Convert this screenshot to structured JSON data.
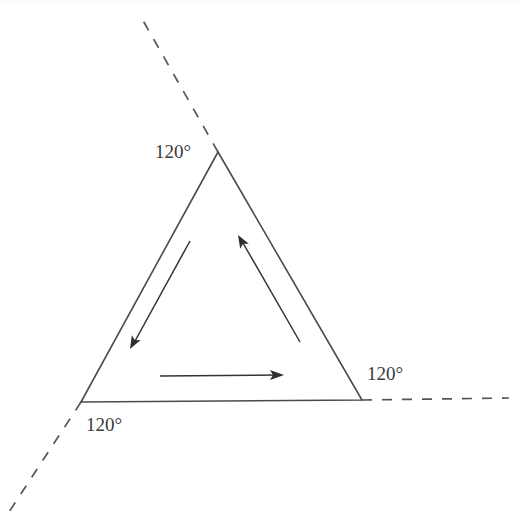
{
  "figure": {
    "background_color": "#ffffff",
    "line_color": "#4a4a4a",
    "dash_color": "#555555",
    "arrow_color": "#2e2e2e",
    "label_color": "#3a3a3a",
    "width": 521,
    "height": 532
  },
  "shape": {
    "name": "triangle",
    "kind": "equilateral",
    "fill": "#ffffff",
    "vertices": [
      {
        "name": "apex",
        "x": 218,
        "y": 152
      },
      {
        "name": "bottom-right",
        "x": 362,
        "y": 400
      },
      {
        "name": "bottom-left",
        "x": 81,
        "y": 402
      }
    ],
    "path": "M 218 152 L 362 400 L 81 402 Z"
  },
  "extensions": [
    {
      "name": "upper-left-dashed-ray",
      "from_vertex": "apex",
      "path": "M 218 152 L 141 17",
      "dash": "10 10"
    },
    {
      "name": "right-dashed-ray",
      "from_vertex": "bottom-right",
      "path": "M 362 400 L 509 398",
      "dash": "10 10"
    },
    {
      "name": "lower-left-dashed-ray",
      "from_vertex": "bottom-left",
      "path": "M 81 402 L 9 512",
      "dash": "10 10"
    }
  ],
  "arrows": [
    {
      "name": "left-side-arrow",
      "direction": "down-left",
      "shaft": {
        "x1": 190,
        "y1": 241,
        "x2": 135,
        "y2": 341
      },
      "head": {
        "x": 130,
        "y": 349,
        "angle_deg": 118.7
      }
    },
    {
      "name": "right-side-arrow",
      "direction": "up-left",
      "shaft": {
        "x1": 300,
        "y1": 342,
        "x2": 243,
        "y2": 243
      },
      "head": {
        "x": 238,
        "y": 235,
        "angle_deg": 240.0
      }
    },
    {
      "name": "base-arrow",
      "direction": "right",
      "shaft": {
        "x1": 160,
        "y1": 376,
        "x2": 275,
        "y2": 375
      },
      "head": {
        "x": 284,
        "y": 375,
        "angle_deg": 0
      }
    }
  ],
  "labels": {
    "top_angle": {
      "text": "120°",
      "x": 155,
      "y": 154
    },
    "right_angle": {
      "text": "120°",
      "x": 367,
      "y": 376
    },
    "bottom_left_angle": {
      "text": "120°",
      "x": 86,
      "y": 427
    }
  },
  "values": {
    "exterior_angle_degrees": "120°",
    "interior_angle_degrees": "60°",
    "angle_count": 3
  }
}
